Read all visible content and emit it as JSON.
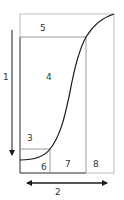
{
  "diagram": {
    "colors": {
      "dark_line": "#2a2a2a",
      "light_line": "#bdbdbd",
      "curve": "#1a1a1a",
      "label": "#333333"
    },
    "regions": [
      {
        "id": "5",
        "label": "5"
      },
      {
        "id": "4",
        "label": "4"
      },
      {
        "id": "3",
        "label": "3"
      },
      {
        "id": "6",
        "label": "6"
      },
      {
        "id": "7",
        "label": "7"
      },
      {
        "id": "8",
        "label": "8"
      }
    ],
    "axes": {
      "vertical_arrow_label": "1",
      "horizontal_arrow_label": "2"
    }
  }
}
